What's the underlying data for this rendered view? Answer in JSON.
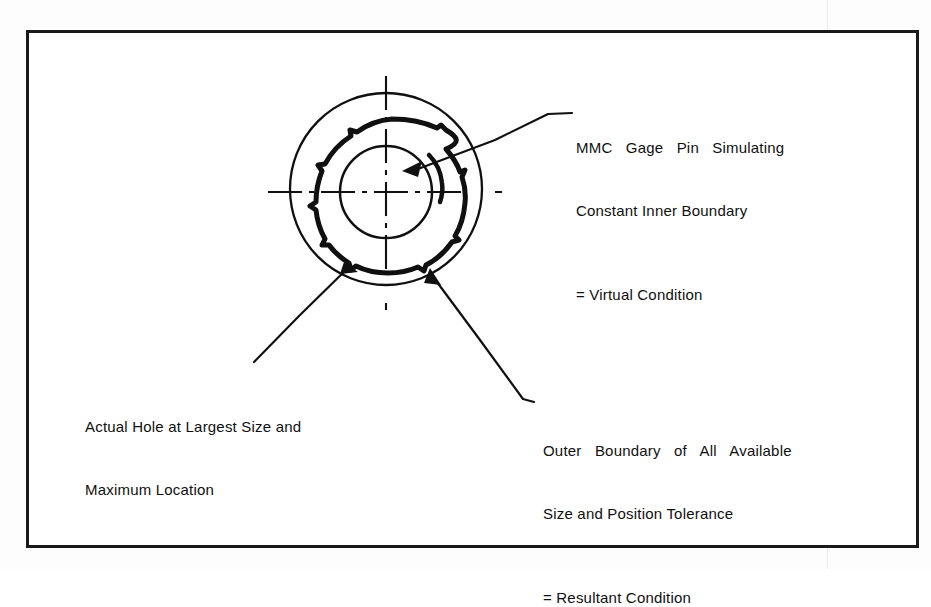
{
  "document": {
    "type": "engineering-drawing",
    "title": "MMC Hole Boundary Diagram",
    "background_color": "#ffffff",
    "ink_color": "#101010"
  },
  "frame": {
    "name": "drawing-border",
    "stroke_color": "#1a1a1a"
  },
  "figure": {
    "center_x": 386,
    "center_y": 190,
    "outer_circle": {
      "label": "Resultant Condition boundary",
      "cx": 386,
      "cy": 189,
      "r": 96,
      "stroke_width": 2.2
    },
    "inner_circle": {
      "label": "MMC gage pin / Virtual Condition",
      "cx": 386,
      "cy": 192,
      "r": 46,
      "stroke_width": 2.4
    },
    "actual_hole": {
      "label": "Actual hole outline, irregular",
      "cx": 392,
      "cy": 193,
      "r_nominal": 74,
      "stroke_width": 5
    },
    "centerlines": {
      "horizontal": {
        "x1": 268,
        "x2": 506,
        "y": 192
      },
      "vertical": {
        "y1": 76,
        "y2": 311,
        "x": 386
      },
      "style": "chain-dashed"
    }
  },
  "callouts": [
    {
      "id": "mmc-gage-pin",
      "line1": "MMC Gage Pin Simulating",
      "line2": "Constant Inner Boundary",
      "equals": "= Virtual Condition",
      "leader_from": [
        404,
        170
      ],
      "leader_to": [
        572,
        113
      ]
    },
    {
      "id": "actual-hole",
      "line1": "Actual Hole at Largest Size and",
      "line2": "Maximum Location",
      "equals": "",
      "leader_from": [
        347,
        264
      ],
      "leader_to": [
        254,
        363
      ]
    },
    {
      "id": "outer-boundary",
      "line1": "Outer Boundary of All Available",
      "line2": "Size and Position Tolerance",
      "equals": "= Resultant Condition",
      "leader_from": [
        433,
        273
      ],
      "leader_to": [
        531,
        404
      ]
    }
  ]
}
